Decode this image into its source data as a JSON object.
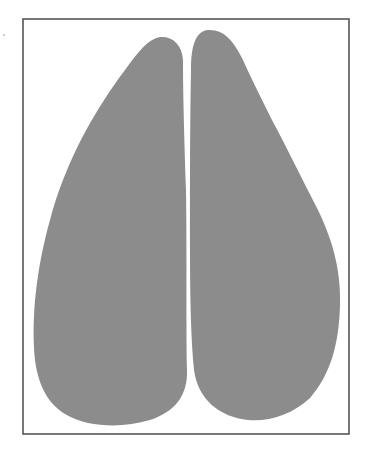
{
  "figure": {
    "frame": {
      "x": 23,
      "y": 19,
      "width": 326,
      "height": 415,
      "stroke": "#555555",
      "fill": "#ffffff"
    },
    "shapes": [
      {
        "name": "left-blob",
        "fill": "#8c8c8c",
        "path": "M 160 37 C 172 36, 182 44, 183 60 C 183 90, 184 130, 186 190 C 187 260, 186 330, 187 370 C 188 395, 175 412, 150 420 C 130 426, 108 427, 88 423 C 58 416, 40 398, 35 360 C 31 320, 36 270, 50 220 C 66 160, 95 110, 125 70 C 138 52, 148 39, 160 37 Z"
      },
      {
        "name": "right-blob",
        "fill": "#8c8c8c",
        "path": "M 208 30 C 222 29, 232 38, 242 58 C 252 80, 262 100, 272 120 C 288 150, 300 175, 318 210 C 335 245, 341 275, 340 305 C 339 345, 330 375, 310 398 C 292 415, 268 422, 248 420 C 220 417, 198 400, 194 370 C 191 340, 190 300, 190 250 C 190 190, 190 120, 191 70 C 191 45, 196 31, 208 30 Z"
      }
    ]
  }
}
